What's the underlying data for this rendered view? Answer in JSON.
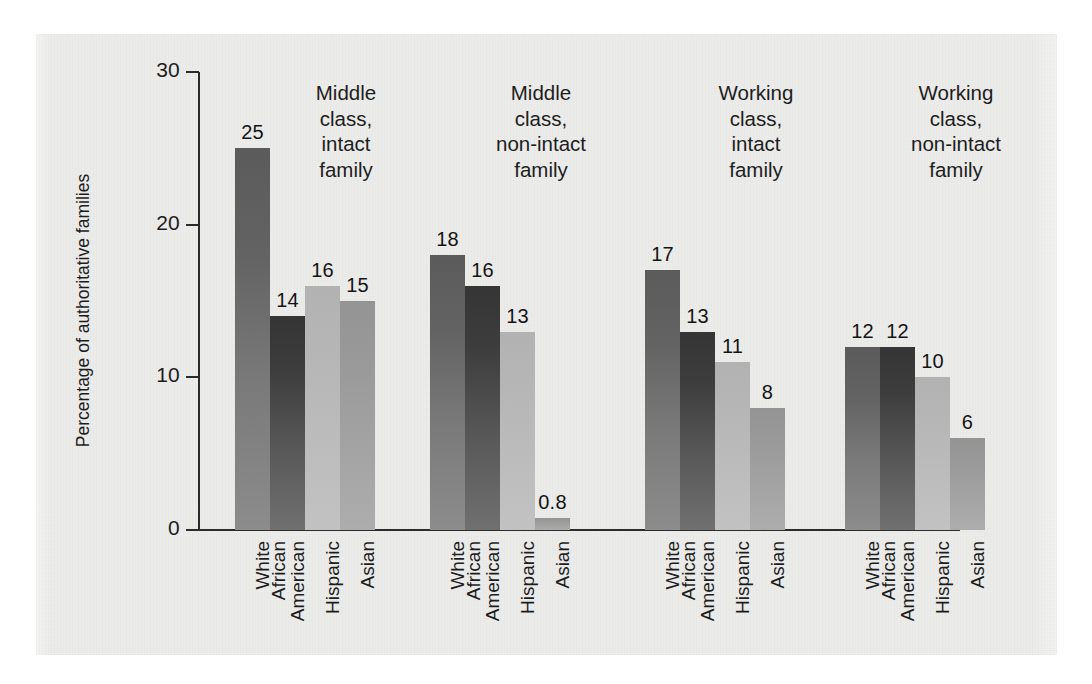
{
  "figure": {
    "panel_background": "#ececeb",
    "axis_color": "#2b2b2b"
  },
  "chart_data": {
    "type": "bar",
    "title": "",
    "subtitle": "",
    "xlabel": "",
    "ylabel": "Percentage of authoritative families",
    "ylim": [
      0,
      30
    ],
    "yticks": [
      0,
      10,
      20,
      30
    ],
    "ytick_labels": [
      "0",
      "10",
      "20",
      "30"
    ],
    "grid": false,
    "legend": "none",
    "categories": [
      "White",
      "African American",
      "Hispanic",
      "Asian"
    ],
    "category_lines": [
      [
        "White"
      ],
      [
        "African",
        "American"
      ],
      [
        "Hispanic"
      ],
      [
        "Asian"
      ]
    ],
    "groups": [
      {
        "header": "Middle class, intact family",
        "header_lines": [
          "Middle",
          "class,",
          "intact",
          "family"
        ],
        "values": [
          25,
          14,
          16,
          15
        ],
        "value_labels": [
          "25",
          "14",
          "16",
          "15"
        ]
      },
      {
        "header": "Middle class, non-intact family",
        "header_lines": [
          "Middle",
          "class,",
          "non-intact",
          "family"
        ],
        "values": [
          18,
          16,
          13,
          0.8
        ],
        "value_labels": [
          "18",
          "16",
          "13",
          "0.8"
        ]
      },
      {
        "header": "Working class, intact family",
        "header_lines": [
          "Working",
          "class,",
          "intact",
          "family"
        ],
        "values": [
          17,
          13,
          11,
          8
        ],
        "value_labels": [
          "17",
          "13",
          "11",
          "8"
        ]
      },
      {
        "header": "Working class, non-intact family",
        "header_lines": [
          "Working",
          "class,",
          "non-intact",
          "family"
        ],
        "values": [
          12,
          12,
          10,
          6
        ],
        "value_labels": [
          "12",
          "12",
          "10",
          "6"
        ]
      }
    ],
    "series_colors": [
      "#6b6b6b",
      "#3f3f3f",
      "#b8b8b8",
      "#9d9d9d"
    ]
  }
}
